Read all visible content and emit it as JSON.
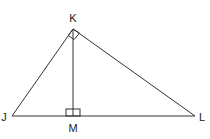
{
  "diagram": {
    "type": "right-triangle-with-altitude",
    "points": {
      "J": {
        "label": "J",
        "x": 12,
        "y": 116,
        "label_x": 4,
        "label_y": 121
      },
      "K": {
        "label": "K",
        "x": 73,
        "y": 29,
        "label_x": 73,
        "label_y": 22
      },
      "L": {
        "label": "L",
        "x": 195,
        "y": 116,
        "label_x": 201,
        "label_y": 121
      },
      "M": {
        "label": "M",
        "x": 73,
        "y": 116,
        "label_x": 73,
        "label_y": 131
      }
    },
    "segments": [
      {
        "name": "JK",
        "from": "J",
        "to": "K"
      },
      {
        "name": "KL",
        "from": "K",
        "to": "L"
      },
      {
        "name": "JL",
        "from": "J",
        "to": "L"
      },
      {
        "name": "KM",
        "from": "K",
        "to": "M"
      }
    ],
    "right_angles": [
      {
        "at": "K",
        "between": [
          "J",
          "L"
        ]
      },
      {
        "at": "M",
        "between": [
          "K",
          "L"
        ]
      }
    ],
    "colors": {
      "line": "#333333",
      "label": "#222222",
      "background": "#ffffff"
    }
  }
}
